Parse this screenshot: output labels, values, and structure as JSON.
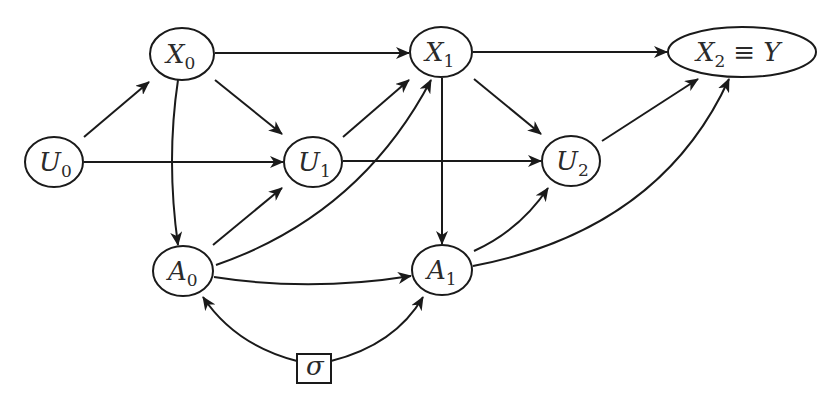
{
  "diagram": {
    "type": "causal-dag",
    "colors": {
      "stroke": "#1a1a1a",
      "text": "#2a2a2a",
      "background": "#ffffff"
    },
    "nodes": [
      {
        "id": "X0",
        "base": "X",
        "sub": "0",
        "shape": "ellipse",
        "cx": 182,
        "cy": 54,
        "rx": 32,
        "ry": 26
      },
      {
        "id": "U0",
        "base": "U",
        "sub": "0",
        "shape": "ellipse",
        "cx": 54,
        "cy": 162,
        "rx": 29,
        "ry": 25
      },
      {
        "id": "U1",
        "base": "U",
        "sub": "1",
        "shape": "ellipse",
        "cx": 313,
        "cy": 162,
        "rx": 29,
        "ry": 25
      },
      {
        "id": "X1",
        "base": "X",
        "sub": "1",
        "shape": "ellipse",
        "cx": 441,
        "cy": 52,
        "rx": 31,
        "ry": 25
      },
      {
        "id": "X2",
        "base": "X",
        "sub": "2",
        "suffix_op": "≡",
        "suffix": "Y",
        "shape": "ellipse",
        "cx": 742,
        "cy": 52,
        "rx": 74,
        "ry": 25
      },
      {
        "id": "U2",
        "base": "U",
        "sub": "2",
        "shape": "ellipse",
        "cx": 571,
        "cy": 161,
        "rx": 29,
        "ry": 25
      },
      {
        "id": "A0",
        "base": "A",
        "sub": "0",
        "shape": "ellipse",
        "cx": 183,
        "cy": 271,
        "rx": 30,
        "ry": 25
      },
      {
        "id": "A1",
        "base": "A",
        "sub": "1",
        "shape": "ellipse",
        "cx": 442,
        "cy": 270,
        "rx": 30,
        "ry": 25
      },
      {
        "id": "sigma",
        "base": "σ",
        "sub": "",
        "shape": "rect",
        "x": 297,
        "y": 354,
        "w": 34,
        "h": 29
      }
    ],
    "edges": [
      {
        "from": "U0",
        "to": "X0"
      },
      {
        "from": "U0",
        "to": "U1"
      },
      {
        "from": "X0",
        "to": "X1"
      },
      {
        "from": "X0",
        "to": "U1"
      },
      {
        "from": "X0",
        "to": "A0",
        "curved": true
      },
      {
        "from": "U1",
        "to": "X1"
      },
      {
        "from": "U1",
        "to": "U2"
      },
      {
        "from": "A0",
        "to": "U1"
      },
      {
        "from": "A0",
        "to": "X1",
        "curved": true
      },
      {
        "from": "A0",
        "to": "A1",
        "curved": true
      },
      {
        "from": "X1",
        "to": "X2"
      },
      {
        "from": "X1",
        "to": "U2"
      },
      {
        "from": "X1",
        "to": "A1"
      },
      {
        "from": "U2",
        "to": "X2"
      },
      {
        "from": "A1",
        "to": "U2",
        "curved": true
      },
      {
        "from": "A1",
        "to": "X2",
        "curved": true
      },
      {
        "from": "sigma",
        "to": "A0",
        "curved": true
      },
      {
        "from": "sigma",
        "to": "A1",
        "curved": true
      }
    ]
  },
  "labels": {
    "X0": {
      "base": "X",
      "sub": "0"
    },
    "U0": {
      "base": "U",
      "sub": "0"
    },
    "U1": {
      "base": "U",
      "sub": "1"
    },
    "X1": {
      "base": "X",
      "sub": "1"
    },
    "X2": {
      "base": "X",
      "sub": "2",
      "op": "≡",
      "rhs": "Y"
    },
    "U2": {
      "base": "U",
      "sub": "2"
    },
    "A0": {
      "base": "A",
      "sub": "0"
    },
    "A1": {
      "base": "A",
      "sub": "1"
    },
    "sigma": {
      "base": "σ"
    }
  }
}
